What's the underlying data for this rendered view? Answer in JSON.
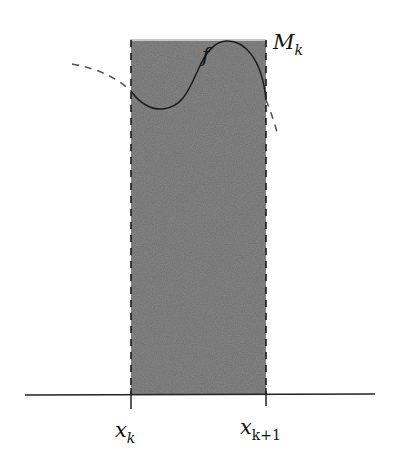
{
  "diagram": {
    "type": "riemann-upper-sum-rectangle",
    "colors": {
      "rect_fill": "#6b6b6b",
      "rect_top_edge": "#c8c8c8",
      "curve": "#1a1a1a",
      "dashed_curve": "#555555",
      "axis": "#222222",
      "background": "#ffffff"
    },
    "labels": {
      "function": "f",
      "sup_value": "M",
      "sup_subscript": "k",
      "left_point": "x",
      "left_subscript": "k",
      "right_point": "x",
      "right_subscript": "k+1"
    }
  }
}
